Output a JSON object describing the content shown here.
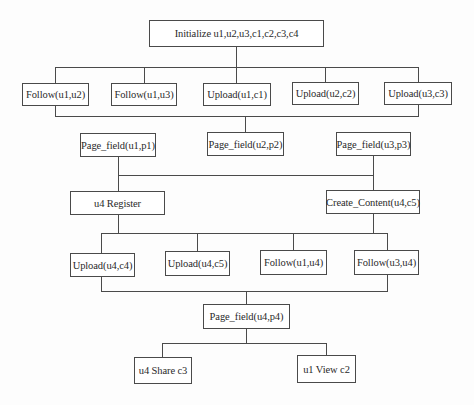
{
  "diagram": {
    "title": "",
    "nodes": {
      "init": "Initialize u1,u2,u3,c1,c2,c3,c4",
      "follow_u1_u2": "Follow(u1,u2)",
      "follow_u1_u3": "Follow(u1,u3)",
      "upload_u1_c1": "Upload(u1,c1)",
      "upload_u2_c2": "Upload(u2,c2)",
      "upload_u3_c3": "Upload(u3,c3)",
      "page_field_u1_p1": "Page_field(u1,p1)",
      "page_field_u2_p2": "Page_field(u2,p2)",
      "page_field_u3_p3": "Page_field(u3,p3)",
      "u4_register": "u4 Register",
      "create_content_u4_c5": "Create_Content(u4,c5)",
      "upload_u4_c4": "Upload(u4,c4)",
      "upload_u4_c5": "Upload(u4,c5)",
      "follow_u1_u4": "Follow(u1,u4)",
      "follow_u3_u4": "Follow(u3,u4)",
      "page_field_u4_p4": "Page_field(u4,p4)",
      "u4_share_c3": "u4 Share c3",
      "u1_view_c2": "u1 View c2"
    },
    "edges": [
      [
        "init",
        "follow_u1_u2"
      ],
      [
        "init",
        "follow_u1_u3"
      ],
      [
        "init",
        "upload_u1_c1"
      ],
      [
        "init",
        "upload_u2_c2"
      ],
      [
        "init",
        "upload_u3_c3"
      ],
      [
        "follow_u1_u2",
        "page_field_u2_p2"
      ],
      [
        "upload_u3_c3",
        "page_field_u2_p2"
      ],
      [
        "page_field_u1_p1",
        "u4_register"
      ],
      [
        "page_field_u3_p3",
        "create_content_u4_c5"
      ],
      [
        "u4_register",
        "upload_u4_c4"
      ],
      [
        "u4_register",
        "upload_u4_c5"
      ],
      [
        "create_content_u4_c5",
        "follow_u1_u4"
      ],
      [
        "create_content_u4_c5",
        "follow_u3_u4"
      ],
      [
        "upload_u4_c4",
        "page_field_u4_p4"
      ],
      [
        "follow_u3_u4",
        "page_field_u4_p4"
      ],
      [
        "page_field_u4_p4",
        "u4_share_c3"
      ],
      [
        "page_field_u4_p4",
        "u1_view_c2"
      ]
    ],
    "colors": {
      "line": "#4a4a4a",
      "box_border": "#4a4a4a",
      "background": "#ffffff"
    }
  }
}
